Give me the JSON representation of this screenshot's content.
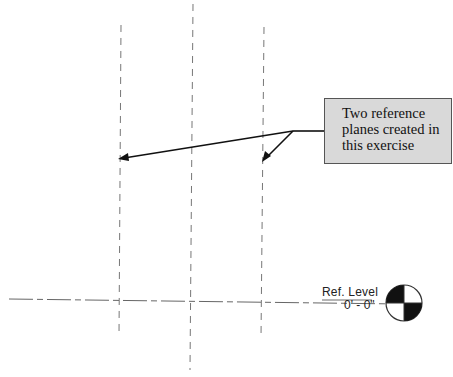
{
  "callout": {
    "lines": [
      "Two reference",
      "planes created in",
      "this exercise"
    ]
  },
  "level": {
    "name": "Ref. Level",
    "elevation": "0' - 0\""
  },
  "colors": {
    "callout_fill": "#d9d9d9",
    "callout_border": "#555555",
    "dashed_line": "#777777",
    "arrow": "#111111"
  }
}
